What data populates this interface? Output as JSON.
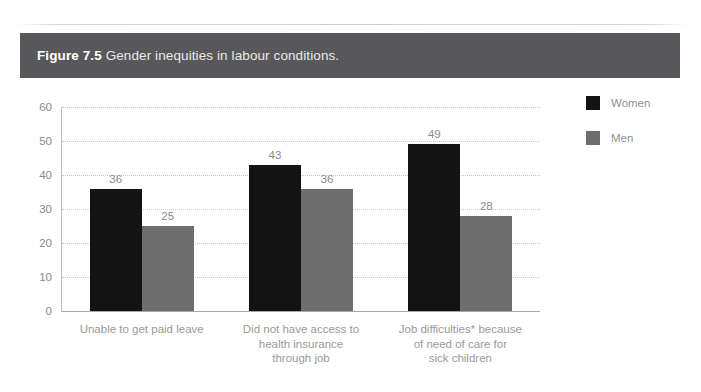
{
  "figure": {
    "number_label": "Figure 7.5",
    "caption": "Gender inequities in labour conditions."
  },
  "legend": {
    "position": "right",
    "items": [
      {
        "label": "Women",
        "color": "#131313",
        "swatch_name": "legend-swatch-women"
      },
      {
        "label": "Men",
        "color": "#6e6e6e",
        "swatch_name": "legend-swatch-men"
      }
    ]
  },
  "axis": {
    "y_ticks": [
      "0",
      "10",
      "20",
      "30",
      "40",
      "50",
      "60"
    ]
  },
  "chart_data": {
    "type": "bar",
    "title": "Gender inequities in labour conditions.",
    "xlabel": "",
    "ylabel": "",
    "ylim": [
      0,
      60
    ],
    "ytick_step": 10,
    "grid": true,
    "legend_position": "right",
    "categories": [
      "Unable to get paid leave",
      "Did not have access to health insurance through job",
      "Job difficulties* because of need of care for sick children"
    ],
    "category_lines": [
      [
        "Unable to get paid leave"
      ],
      [
        "Did not have access to",
        "health insurance",
        "through job"
      ],
      [
        "Job difficulties* because",
        "of need of care for",
        "sick children"
      ]
    ],
    "series": [
      {
        "name": "Women",
        "color": "#131313",
        "values": [
          36,
          43,
          49
        ]
      },
      {
        "name": "Men",
        "color": "#6e6e6e",
        "values": [
          25,
          36,
          28
        ]
      }
    ]
  }
}
